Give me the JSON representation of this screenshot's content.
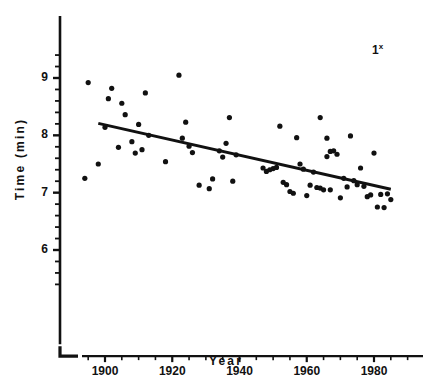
{
  "figure": {
    "panel_annotation": "1",
    "panel_annotation_superscript": "x",
    "caption_fragment": "",
    "ink_color": "#111111",
    "background_color": "#ffffff"
  },
  "chart_data": {
    "type": "scatter",
    "title": "",
    "xlabel": "Year",
    "ylabel": "Time (min)",
    "xlim": [
      1887,
      1998
    ],
    "ylim": [
      5.3,
      9.55
    ],
    "grid": false,
    "legend": null,
    "x_ticks": [
      1900,
      1920,
      1940,
      1960,
      1980
    ],
    "x_tick_labels": [
      "1900",
      "1920",
      "1940",
      "1960",
      "1980"
    ],
    "x_minor_tick_step": 5,
    "y_ticks": [
      6,
      7,
      8,
      9
    ],
    "y_tick_labels": [
      "6",
      "7",
      "8",
      "9"
    ],
    "y_minor_tick_step": 0.2,
    "marker": "filled-circle",
    "marker_size_px": 3.4,
    "points": [
      {
        "year": 1894,
        "time": 7.25
      },
      {
        "year": 1895,
        "time": 8.92
      },
      {
        "year": 1898,
        "time": 7.5
      },
      {
        "year": 1900,
        "time": 8.14
      },
      {
        "year": 1901,
        "time": 8.64
      },
      {
        "year": 1902,
        "time": 8.82
      },
      {
        "year": 1904,
        "time": 7.79
      },
      {
        "year": 1905,
        "time": 8.56
      },
      {
        "year": 1906,
        "time": 8.36
      },
      {
        "year": 1908,
        "time": 7.89
      },
      {
        "year": 1909,
        "time": 7.69
      },
      {
        "year": 1910,
        "time": 8.19
      },
      {
        "year": 1911,
        "time": 7.75
      },
      {
        "year": 1912,
        "time": 8.74
      },
      {
        "year": 1913,
        "time": 8.0
      },
      {
        "year": 1918,
        "time": 7.54
      },
      {
        "year": 1922,
        "time": 9.05
      },
      {
        "year": 1923,
        "time": 7.95
      },
      {
        "year": 1924,
        "time": 8.23
      },
      {
        "year": 1925,
        "time": 7.81
      },
      {
        "year": 1926,
        "time": 7.7
      },
      {
        "year": 1928,
        "time": 7.13
      },
      {
        "year": 1931,
        "time": 7.07
      },
      {
        "year": 1932,
        "time": 7.24
      },
      {
        "year": 1934,
        "time": 7.73
      },
      {
        "year": 1935,
        "time": 7.62
      },
      {
        "year": 1936,
        "time": 7.86
      },
      {
        "year": 1937,
        "time": 8.31
      },
      {
        "year": 1938,
        "time": 7.2
      },
      {
        "year": 1939,
        "time": 7.66
      },
      {
        "year": 1947,
        "time": 7.43
      },
      {
        "year": 1948,
        "time": 7.37
      },
      {
        "year": 1949,
        "time": 7.4
      },
      {
        "year": 1950,
        "time": 7.42
      },
      {
        "year": 1951,
        "time": 7.44
      },
      {
        "year": 1952,
        "time": 8.16
      },
      {
        "year": 1953,
        "time": 7.18
      },
      {
        "year": 1954,
        "time": 7.14
      },
      {
        "year": 1955,
        "time": 7.02
      },
      {
        "year": 1956,
        "time": 6.99
      },
      {
        "year": 1957,
        "time": 7.96
      },
      {
        "year": 1958,
        "time": 7.5
      },
      {
        "year": 1959,
        "time": 7.41
      },
      {
        "year": 1960,
        "time": 6.95
      },
      {
        "year": 1961,
        "time": 7.13
      },
      {
        "year": 1962,
        "time": 7.36
      },
      {
        "year": 1963,
        "time": 7.09
      },
      {
        "year": 1964,
        "time": 7.08
      },
      {
        "year": 1964,
        "time": 8.31
      },
      {
        "year": 1965,
        "time": 7.05
      },
      {
        "year": 1966,
        "time": 7.63
      },
      {
        "year": 1966,
        "time": 7.95
      },
      {
        "year": 1967,
        "time": 7.72
      },
      {
        "year": 1967,
        "time": 7.05
      },
      {
        "year": 1968,
        "time": 7.73
      },
      {
        "year": 1969,
        "time": 7.67
      },
      {
        "year": 1970,
        "time": 6.91
      },
      {
        "year": 1971,
        "time": 7.25
      },
      {
        "year": 1972,
        "time": 7.1
      },
      {
        "year": 1973,
        "time": 7.99
      },
      {
        "year": 1974,
        "time": 7.21
      },
      {
        "year": 1975,
        "time": 7.14
      },
      {
        "year": 1976,
        "time": 7.43
      },
      {
        "year": 1977,
        "time": 7.11
      },
      {
        "year": 1978,
        "time": 6.93
      },
      {
        "year": 1979,
        "time": 6.96
      },
      {
        "year": 1980,
        "time": 7.69
      },
      {
        "year": 1981,
        "time": 6.75
      },
      {
        "year": 1982,
        "time": 6.97
      },
      {
        "year": 1983,
        "time": 6.74
      },
      {
        "year": 1984,
        "time": 6.98
      },
      {
        "year": 1985,
        "time": 6.88
      }
    ],
    "fit_line": {
      "name": "linear regression",
      "x_start": 1898,
      "y_start": 8.21,
      "x_end": 1985,
      "y_end": 7.06,
      "slope_per_year": -0.0132
    }
  }
}
